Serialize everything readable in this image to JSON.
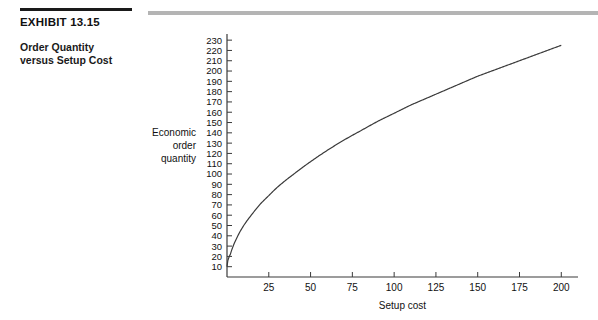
{
  "exhibit": {
    "label": "EXHIBIT 13.15",
    "subtitle_line1": "Order Quantity",
    "subtitle_line2": "versus Setup Cost"
  },
  "colors": {
    "rule_black": "#1a1a1a",
    "rule_gray": "#b4b4b4",
    "axis": "#3a3a3a",
    "curve": "#3a3a3a",
    "text": "#111111",
    "background": "#ffffff"
  },
  "chart_data": {
    "type": "line",
    "title": "",
    "xlabel": "Setup cost",
    "ylabel": "Economic order quantity",
    "ylabel_lines": [
      "Economic",
      "order",
      "quantity"
    ],
    "xlim": [
      0,
      210
    ],
    "ylim": [
      0,
      235
    ],
    "grid": false,
    "legend": null,
    "xticks": [
      25,
      50,
      75,
      100,
      125,
      150,
      175,
      200
    ],
    "yticks": [
      10,
      20,
      30,
      40,
      50,
      60,
      70,
      80,
      90,
      100,
      110,
      120,
      130,
      140,
      150,
      160,
      170,
      180,
      190,
      200,
      210,
      220,
      230
    ],
    "series": [
      {
        "name": "Economic order quantity",
        "x": [
          0,
          2,
          5,
          10,
          15,
          20,
          25,
          30,
          40,
          50,
          60,
          70,
          80,
          90,
          100,
          110,
          120,
          130,
          140,
          150,
          160,
          170,
          180,
          190,
          200
        ],
        "values": [
          10,
          22,
          35,
          50,
          61,
          71,
          79,
          87,
          100,
          112,
          123,
          133,
          142,
          151,
          159,
          167,
          174,
          181,
          188,
          195,
          201,
          207,
          213,
          219,
          225
        ]
      }
    ],
    "relationship": "square-root: EOQ increases with the square root of setup cost"
  }
}
